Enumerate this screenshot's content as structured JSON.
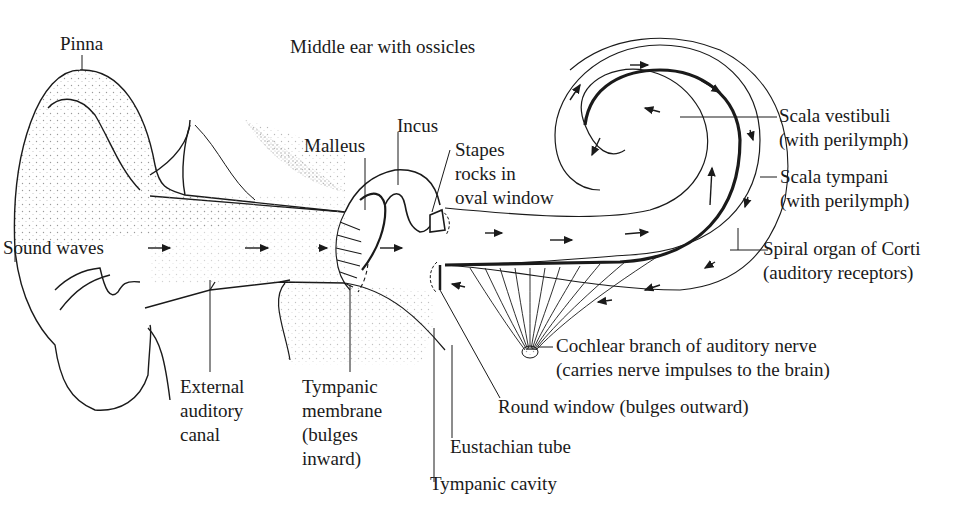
{
  "diagram": {
    "colors": {
      "ink": "#1a1a1a",
      "background": "#ffffff",
      "stipple": "#9a9a9a"
    },
    "labels": {
      "pinna": "Pinna",
      "middle_ear": "Middle ear with ossicles",
      "incus": "Incus",
      "malleus": "Malleus",
      "stapes": [
        "Stapes",
        "rocks in",
        "oval window"
      ],
      "sound_waves": "Sound waves",
      "scala_vestibuli": [
        "Scala vestibuli",
        "(with perilymph)"
      ],
      "scala_tympani": [
        "Scala tympani",
        "(with perilymph)"
      ],
      "spiral_organ": [
        "Spiral organ of Corti",
        "(auditory receptors)"
      ],
      "cochlear_nerve": [
        "Cochlear branch of auditory nerve",
        "(carries nerve impulses to the brain)"
      ],
      "round_window": "Round window (bulges outward)",
      "external_canal": [
        "External",
        "auditory",
        "canal"
      ],
      "tympanic_membrane": [
        "Tympanic",
        "membrane",
        "(bulges",
        "inward)"
      ],
      "eustachian_tube": "Eustachian tube",
      "tympanic_cavity": "Tympanic cavity"
    },
    "flow_arrows": {
      "outer_ear": 3,
      "middle_ear": 1,
      "scala_vestibuli": 6,
      "scala_tympani": 7
    }
  }
}
